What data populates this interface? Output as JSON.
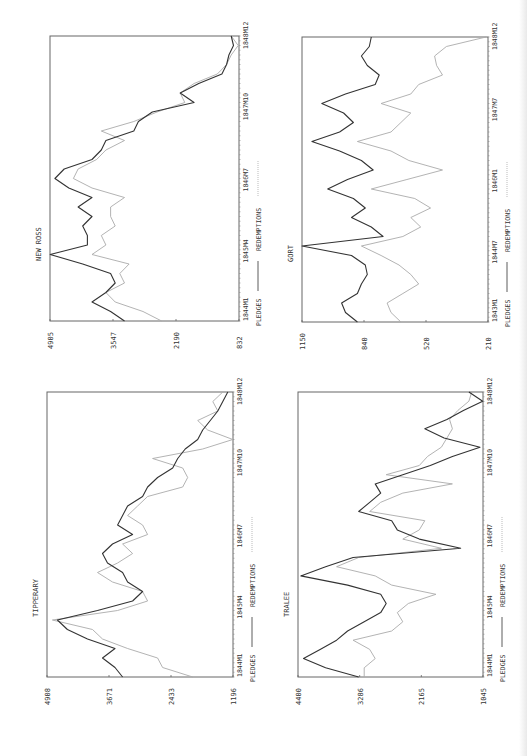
{
  "page": {
    "background": "#ffffff",
    "orientation": "rotated -90deg (time axis runs bottom-to-top, value axis high-to-low left-to-right)"
  },
  "legend": {
    "series_a": "PLEDGES",
    "series_b": "REDEMPTIONS",
    "color_a": "#333333",
    "color_b": "#aaaaaa"
  },
  "chart_data": [
    {
      "type": "line",
      "title": "NEW ROSS",
      "box": {
        "left": 50,
        "top": 36,
        "width": 189,
        "height": 285
      },
      "ylim": [
        832,
        4905
      ],
      "yticks": [
        "4905",
        "3547",
        "2190",
        "832"
      ],
      "xticks": [
        "1844M1",
        "1845M4",
        "1846M7",
        "1847M10",
        "1848M12"
      ],
      "xlabel": "",
      "ylabel": "",
      "series": [
        {
          "name": "PLEDGES",
          "values": [
            3300,
            3600,
            4000,
            3700,
            3500,
            3600,
            4200,
            4900,
            4100,
            4100,
            4200,
            4000,
            4300,
            4000,
            4500,
            4800,
            4600,
            4000,
            3800,
            3700,
            3100,
            3000,
            2700,
            1800,
            2100,
            1700,
            1200,
            1100,
            1050,
            950,
            1000
          ]
        },
        {
          "name": "REDEMPTIONS",
          "values": [
            2500,
            2900,
            3500,
            3700,
            3300,
            3400,
            3200,
            4000,
            3700,
            3800,
            3500,
            3600,
            3600,
            3300,
            4000,
            4400,
            4300,
            3900,
            3700,
            3300,
            3800,
            3100,
            2600,
            2000,
            2100,
            1800,
            1300,
            1100,
            1000,
            850,
            1000
          ]
        }
      ]
    },
    {
      "type": "line",
      "title": "GORT",
      "box": {
        "left": 302,
        "top": 37,
        "width": 186,
        "height": 285
      },
      "ylim": [
        210,
        1150
      ],
      "yticks": [
        "1150",
        "840",
        "520",
        "210"
      ],
      "xticks": [
        "1843M1",
        "1844M7",
        "1846M1",
        "1847M7",
        "1848M12"
      ],
      "xlabel": "",
      "ylabel": "",
      "series": [
        {
          "name": "PLEDGES",
          "values": [
            870,
            930,
            950,
            870,
            850,
            820,
            830,
            900,
            1150,
            740,
            800,
            900,
            830,
            890,
            1020,
            920,
            790,
            850,
            960,
            1100,
            960,
            890,
            940,
            1050,
            930,
            780,
            760,
            820,
            850,
            810,
            800
          ]
        },
        {
          "name": "REDEMPTIONS",
          "values": [
            650,
            700,
            720,
            640,
            560,
            600,
            660,
            750,
            850,
            640,
            550,
            600,
            500,
            580,
            800,
            620,
            440,
            610,
            700,
            870,
            700,
            650,
            600,
            750,
            600,
            560,
            440,
            470,
            480,
            420,
            220
          ]
        }
      ]
    },
    {
      "type": "line",
      "title": "TIPPERARY",
      "box": {
        "left": 47,
        "top": 392,
        "width": 186,
        "height": 285
      },
      "ylim": [
        1196,
        4908
      ],
      "yticks": [
        "4908",
        "3671",
        "2433",
        "1196"
      ],
      "xticks": [
        "1844M1",
        "1845M4",
        "1846M7",
        "1847M10",
        "1848M12"
      ],
      "xlabel": "",
      "ylabel": "",
      "series": [
        {
          "name": "PLEDGES",
          "values": [
            3400,
            3550,
            3800,
            3550,
            4100,
            4500,
            4700,
            3900,
            3200,
            3000,
            3300,
            3400,
            3700,
            3800,
            3600,
            3200,
            3500,
            3400,
            3300,
            3000,
            2900,
            2700,
            2400,
            2300,
            2150,
            1900,
            1800,
            1650,
            1500,
            1400,
            1300
          ]
        },
        {
          "name": "REDEMPTIONS",
          "values": [
            2000,
            2600,
            2700,
            3300,
            3800,
            4000,
            4800,
            3500,
            2900,
            3000,
            3600,
            3900,
            3500,
            3200,
            3400,
            2900,
            3000,
            3300,
            3100,
            2900,
            2200,
            2100,
            2200,
            2800,
            1800,
            1200,
            1700,
            1900,
            1500,
            1600,
            1400
          ]
        }
      ]
    },
    {
      "type": "line",
      "title": "TRALEE",
      "box": {
        "left": 298,
        "top": 392,
        "width": 185,
        "height": 285
      },
      "ylim": [
        1045,
        4400
      ],
      "yticks": [
        "4400",
        "3286",
        "2165",
        "1045"
      ],
      "xticks": [
        "1844M1",
        "1845M4",
        "1846M7",
        "1847M10",
        "1848M12"
      ],
      "xlabel": "",
      "ylabel": "",
      "series": [
        {
          "name": "PLEDGES",
          "values": [
            3300,
            3900,
            4300,
            4000,
            3700,
            3500,
            3200,
            2900,
            2800,
            2900,
            3500,
            4350,
            3900,
            3400,
            1450,
            2200,
            2600,
            2700,
            3300,
            3100,
            2900,
            3000,
            2500,
            2000,
            1600,
            1100,
            1750,
            2100,
            1700,
            1400,
            1050,
            1300
          ]
        },
        {
          "name": "REDEMPTIONS",
          "values": [
            3200,
            3200,
            3000,
            3100,
            3400,
            2700,
            2500,
            2600,
            2400,
            1900,
            2700,
            3000,
            3700,
            3300,
            1800,
            2500,
            2200,
            2100,
            3100,
            2900,
            2500,
            1600,
            2800,
            2200,
            2050,
            1800,
            1700,
            1600,
            1650,
            1500,
            1300,
            1250
          ]
        }
      ]
    }
  ]
}
